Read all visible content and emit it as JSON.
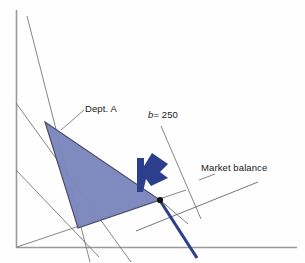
{
  "figure": {
    "type": "economics-linear-programming-diagram",
    "background_color": "#fefefe",
    "width": 305,
    "height": 263
  },
  "labels": {
    "dept_a": "Dept. A",
    "b_symbol": "b",
    "b_equals_value": "= 250",
    "b_full": "b = 250",
    "market_balance": "Market balance"
  },
  "colors": {
    "feasible_region_fill": "#7b86bd",
    "feasible_region_edge": "#4a4a68",
    "constraint_line": "#6f6f6f",
    "axis": "#9a9a9a",
    "highlight_blue": "#2b3f8c",
    "arrow_blue": "#2b3f8c",
    "vertex_dot": "#111111",
    "text": "#1a1a1a"
  },
  "geometry": {
    "axes": {
      "origin": [
        16,
        247
      ],
      "y_axis_top": [
        16,
        10
      ],
      "x_axis_right": [
        297,
        247
      ]
    },
    "feasible_region_vertices": [
      [
        45,
        122
      ],
      [
        160,
        200
      ],
      [
        78,
        228
      ]
    ],
    "market_balance_line": [
      [
        137,
        230
      ],
      [
        257,
        182
      ]
    ],
    "b_250_line": [
      [
        160,
        200
      ],
      [
        196,
        255
      ]
    ],
    "equilibrium_point": [
      160,
      200
    ],
    "arrow_direction": "up-right",
    "constraint_lines": [
      {
        "name": "steep-line-from-top-left",
        "from": [
          27,
          16
        ],
        "to": [
          88,
          258
        ]
      },
      {
        "name": "line-from-left-axis-upper",
        "from": [
          16,
          103
        ],
        "to": [
          128,
          258
        ]
      },
      {
        "name": "line-from-left-axis-lower",
        "from": [
          16,
          170
        ],
        "to": [
          95,
          252
        ]
      },
      {
        "name": "line-from-origin-to-equilibrium",
        "from": [
          16,
          247
        ],
        "to": [
          180,
          192
        ]
      },
      {
        "name": "line-through-equilibrium-short",
        "from": [
          160,
          200
        ],
        "to": [
          185,
          222
        ]
      },
      {
        "name": "b-250-guide-line",
        "from": [
          160,
          126
        ],
        "to": [
          200,
          218
        ]
      }
    ]
  }
}
